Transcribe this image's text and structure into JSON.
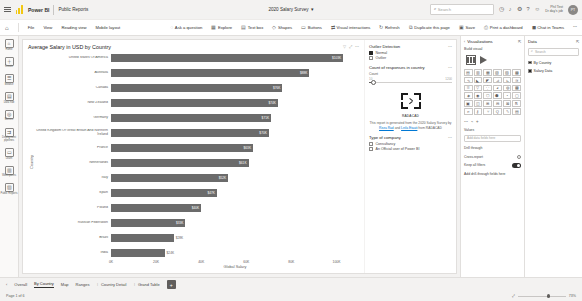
{
  "titlebar": {
    "brand": "Power BI",
    "workspace": "Public Reports",
    "document_title": "2020 Salary Survey",
    "search_placeholder": "Search",
    "account_line1": "Phil Test",
    "account_line2": "Dr day's job",
    "avatar_initials": "PT"
  },
  "ribbon": {
    "home_icon": "home-icon",
    "items": [
      {
        "label": "File",
        "icon": "file-icon"
      },
      {
        "label": "View",
        "icon": "view-icon"
      },
      {
        "label": "Reading view",
        "icon": "reading-view-icon"
      },
      {
        "label": "Mobile layout",
        "icon": "mobile-layout-icon"
      }
    ],
    "tools": [
      {
        "label": "Ask a question",
        "icon": "chat-icon"
      },
      {
        "label": "Explore",
        "icon": "explore-icon"
      },
      {
        "label": "Text box",
        "icon": "textbox-icon"
      },
      {
        "label": "Shapes",
        "icon": "shapes-icon"
      },
      {
        "label": "Buttons",
        "icon": "buttons-icon"
      },
      {
        "label": "Visual interactions",
        "icon": "interactions-icon"
      },
      {
        "label": "Refresh",
        "icon": "refresh-icon"
      },
      {
        "label": "Duplicate this page",
        "icon": "duplicate-icon"
      },
      {
        "label": "Save",
        "icon": "save-icon"
      },
      {
        "label": "Print a dashboard",
        "icon": "print-icon"
      },
      {
        "label": "Chat in Teams",
        "icon": "teams-icon"
      }
    ]
  },
  "rail": {
    "items": [
      {
        "label": "Home",
        "icon": "home-icon"
      },
      {
        "label": "Create",
        "icon": "create-icon"
      },
      {
        "label": "Browse",
        "icon": "browse-icon"
      },
      {
        "label": "Data hub",
        "icon": "data-hub-icon"
      },
      {
        "label": "Metrics",
        "icon": "metrics-icon"
      },
      {
        "label": "Deployment pipelines",
        "icon": "pipeline-icon"
      },
      {
        "label": "Learn",
        "icon": "learn-icon"
      },
      {
        "label": "Workspaces",
        "icon": "workspaces-icon"
      },
      {
        "label": "Public Reports",
        "icon": "report-icon"
      }
    ]
  },
  "chart_data": {
    "type": "bar",
    "orientation": "horizontal",
    "title": "Average Salary in USD by Country",
    "xlabel": "Global Salary",
    "ylabel": "Country",
    "xlim": [
      0,
      110000
    ],
    "xticks": [
      "0K",
      "20K",
      "40K",
      "60K",
      "80K",
      "100K"
    ],
    "xtick_values": [
      0,
      20000,
      40000,
      60000,
      80000,
      100000
    ],
    "grid": false,
    "legend": "none",
    "bar_color": "#6b6b6b",
    "categories": [
      "United States Of America",
      "Australia",
      "Canada",
      "New Zealand",
      "Germany",
      "United Kingdom Of Great Britain And Northern Ireland",
      "France",
      "Netherlands",
      "Italy",
      "Spain",
      "Poland",
      "Russian Federation",
      "Brazil",
      "India"
    ],
    "values": [
      103000,
      88000,
      76000,
      74000,
      71000,
      70000,
      63000,
      61000,
      52000,
      47000,
      40000,
      33000,
      28000,
      24000
    ],
    "value_labels": [
      "$103K",
      "$88K",
      "$76K",
      "$74K",
      "$71K",
      "$70K",
      "$63K",
      "$61K",
      "$52K",
      "$47K",
      "$40K",
      "$33K",
      "$28K",
      "$24K"
    ]
  },
  "report_side": {
    "outlier": {
      "title": "Outlier Detection",
      "more_icon": "more-options-icon",
      "options": [
        {
          "label": "Normal",
          "checked": true
        },
        {
          "label": "Outlier",
          "checked": false
        }
      ]
    },
    "count_slider": {
      "title": "Count of responses in country",
      "subtitle": "Count",
      "min_label": "10",
      "max_label": "1200",
      "more_icon": "more-options-icon"
    },
    "logo": {
      "name": "RADACAD",
      "note_line1": "This report is generated from",
      "note_line2": "the 2020 Salary Survey by",
      "link1": "Reza Rad",
      "note_line3": "and",
      "link2": "Leila Etaati",
      "note_line4": "from RADACAD"
    },
    "company": {
      "title": "Type of company",
      "more_icon": "more-options-icon",
      "options": [
        {
          "label": "Consultancy",
          "checked": false
        },
        {
          "label": "An Official user of Power BI",
          "checked": false
        }
      ]
    }
  },
  "visualizations_pane": {
    "title": "Visualizations",
    "collapse_icon": "chevron-left-icon",
    "pin_icon": "pin-icon",
    "subtitle": "Build visual",
    "selected_visual": "clustered-bar-chart-icon",
    "play_axis_icon": "play-axis-icon",
    "gallery": [
      "stacked-bar-chart-icon",
      "stacked-column-chart-icon",
      "clustered-bar-chart-icon",
      "clustered-column-chart-icon",
      "100-stacked-bar-icon",
      "100-stacked-column-icon",
      "line-chart-icon",
      "area-chart-icon",
      "stacked-area-icon",
      "line-stacked-column-icon",
      "line-clustered-column-icon",
      "ribbon-chart-icon",
      "waterfall-chart-icon",
      "funnel-chart-icon",
      "scatter-chart-icon",
      "pie-chart-icon",
      "donut-chart-icon",
      "treemap-icon",
      "map-icon",
      "filled-map-icon",
      "shape-map-icon",
      "azure-map-icon",
      "gauge-icon",
      "card-icon",
      "multi-row-card-icon",
      "kpi-icon",
      "slicer-icon",
      "table-icon",
      "matrix-icon",
      "r-visual-icon",
      "python-visual-icon",
      "key-influencers-icon",
      "decomposition-tree-icon",
      "q-and-a-icon",
      "smart-narrative-icon",
      "paginated-report-icon"
    ],
    "field_section_label": "Values",
    "field_placeholder": "Add data fields here",
    "options": [
      {
        "label": "Drill through",
        "control": "none"
      },
      {
        "label": "Cross-report",
        "control": "radio"
      },
      {
        "label": "Keep all filters",
        "control": "toggle",
        "state": "On"
      }
    ],
    "drill_placeholder": "Add drill-through fields here"
  },
  "data_pane": {
    "title": "Data",
    "pin_icon": "pin-icon",
    "search_placeholder": "Search",
    "search_icon": "search-icon",
    "fields": [
      {
        "label": "By Country",
        "checked": true
      },
      {
        "label": "Salary Data",
        "checked": true
      }
    ]
  },
  "pagetabs": {
    "prev_icon": "chevron-left-icon",
    "tabs": [
      {
        "label": "Overall",
        "active": false
      },
      {
        "label": "By Country",
        "active": true
      },
      {
        "label": "Map",
        "active": false
      },
      {
        "label": "Ranges",
        "active": false
      },
      {
        "label": "Country Detail",
        "active": false
      },
      {
        "label": "Grand Table",
        "active": false
      }
    ],
    "add_label": "+"
  },
  "statusbar": {
    "page_status": "Page 1 of 6",
    "zoom_level": "73%",
    "fit_icon": "fit-to-page-icon"
  }
}
